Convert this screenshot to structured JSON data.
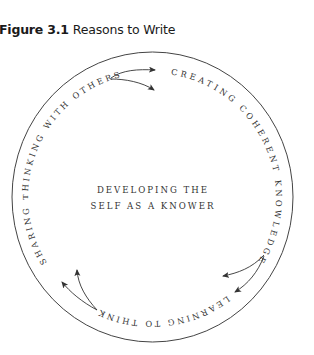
{
  "figure": {
    "label": "Figure 3.1",
    "title": "Reasons to Write"
  },
  "diagram": {
    "type": "cycle",
    "center": {
      "line1": "DEVELOPING THE",
      "line2": "SELF AS A KNOWER"
    },
    "stages": [
      {
        "label": "CREATING COHERENT KNOWLEDGE"
      },
      {
        "label": "LEARNING TO THINK"
      },
      {
        "label": "SHARING THINKING WITH OTHERS"
      }
    ],
    "flow": [
      {
        "from": "SHARING THINKING WITH OTHERS",
        "to": "CREATING COHERENT KNOWLEDGE"
      },
      {
        "from": "CREATING COHERENT KNOWLEDGE",
        "to": "LEARNING TO THINK"
      },
      {
        "from": "LEARNING TO THINK",
        "to": "SHARING THINKING WITH OTHERS"
      }
    ],
    "colors": {
      "stroke": "#333333",
      "text": "#333333"
    }
  }
}
